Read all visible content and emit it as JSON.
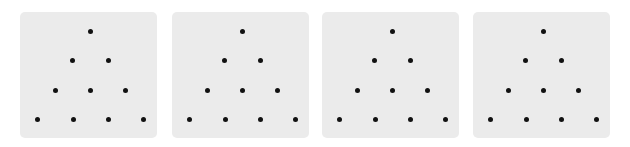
{
  "panels": [
    {
      "left": 20
    },
    {
      "left": 172
    },
    {
      "left": 322
    },
    {
      "left": 473
    }
  ],
  "pattern": {
    "rows": [
      1,
      2,
      3,
      4
    ],
    "dots": [
      [
        70,
        19
      ],
      [
        52,
        48
      ],
      [
        88,
        48
      ],
      [
        35,
        78
      ],
      [
        70,
        78
      ],
      [
        105,
        78
      ],
      [
        17,
        107
      ],
      [
        53,
        107
      ],
      [
        88,
        107
      ],
      [
        123,
        107
      ]
    ]
  },
  "colors": {
    "panel": "#ebebeb",
    "dot": "#111111"
  }
}
